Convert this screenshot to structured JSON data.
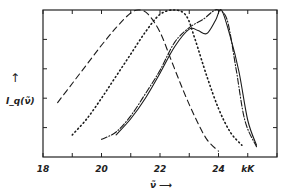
{
  "chart_data": {
    "type": "line",
    "title": "",
    "xlabel": "ν̃ ⟶",
    "ylabel": "I_q(ν̃)",
    "x_unit": "kK",
    "xlim": [
      18,
      26
    ],
    "ylim": [
      0,
      1
    ],
    "x_ticks": [
      18,
      19,
      20,
      21,
      22,
      23,
      24,
      25,
      26
    ],
    "x_tick_labels": [
      "18",
      "20",
      "22",
      "24",
      "kK"
    ],
    "grid": false,
    "legend": null,
    "series": [
      {
        "name": "dashed",
        "style": "dashed",
        "x": [
          18.5,
          19.0,
          19.5,
          20.0,
          20.5,
          21.0,
          21.3,
          21.6,
          22.0,
          22.4,
          22.8,
          23.2,
          23.6,
          24.0
        ],
        "y": [
          0.37,
          0.5,
          0.63,
          0.76,
          0.88,
          0.98,
          1.0,
          0.97,
          0.85,
          0.65,
          0.45,
          0.27,
          0.12,
          0.04
        ]
      },
      {
        "name": "dotted",
        "style": "dotted",
        "x": [
          19.0,
          19.5,
          20.0,
          20.5,
          21.0,
          21.5,
          22.0,
          22.5,
          22.9,
          23.2,
          23.6,
          24.0,
          24.4,
          24.8
        ],
        "y": [
          0.15,
          0.26,
          0.4,
          0.55,
          0.7,
          0.85,
          0.97,
          1.0,
          0.96,
          0.8,
          0.55,
          0.33,
          0.17,
          0.08
        ]
      },
      {
        "name": "dash-dot",
        "style": "dashdot",
        "x": [
          20.0,
          20.5,
          21.0,
          21.5,
          22.0,
          22.5,
          23.0,
          23.5,
          23.8,
          24.0,
          24.3,
          24.6,
          24.9,
          25.3
        ],
        "y": [
          0.12,
          0.17,
          0.28,
          0.43,
          0.59,
          0.78,
          0.88,
          0.94,
          0.99,
          1.0,
          0.93,
          0.6,
          0.25,
          0.07
        ]
      },
      {
        "name": "solid",
        "style": "solid",
        "x": [
          20.5,
          21.0,
          21.5,
          22.0,
          22.5,
          23.0,
          23.3,
          23.6,
          23.9,
          24.1,
          24.4,
          24.7,
          25.0,
          25.3
        ],
        "y": [
          0.15,
          0.26,
          0.4,
          0.57,
          0.75,
          0.87,
          0.86,
          0.84,
          0.93,
          1.0,
          0.82,
          0.58,
          0.25,
          0.08
        ]
      }
    ]
  }
}
